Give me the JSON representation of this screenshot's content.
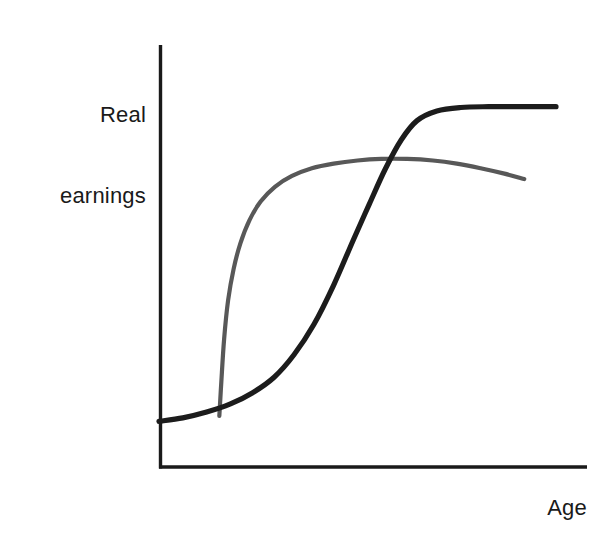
{
  "chart_data": {
    "type": "line",
    "title": "",
    "subtitle": "",
    "xlabel": "Age",
    "ylabel": "Real earnings",
    "ylabel_lines": [
      "Real",
      "earnings"
    ],
    "grid": false,
    "legend": "none",
    "axes": {
      "x_axis_visible": true,
      "y_axis_visible": true,
      "x_ticks": [],
      "y_ticks": [],
      "xlim": [
        0,
        1
      ],
      "ylim": [
        0,
        1
      ],
      "axis_color": "#1a1a1a"
    },
    "annotations": [],
    "series": [
      {
        "name": "high-skill-profile",
        "color": "#1c1c1c",
        "width": 5.2,
        "description": "S-shaped real earnings profile rising late and plateauing at a high level",
        "x": [
          0.0,
          0.06,
          0.12,
          0.18,
          0.236,
          0.29,
          0.34,
          0.39,
          0.44,
          0.49,
          0.53,
          0.57,
          0.61,
          0.65,
          0.7,
          0.76,
          0.83,
          0.9,
          0.96,
          1.0
        ],
        "y": [
          0.118,
          0.127,
          0.142,
          0.163,
          0.192,
          0.232,
          0.29,
          0.368,
          0.47,
          0.588,
          0.68,
          0.77,
          0.845,
          0.895,
          0.92,
          0.929,
          0.931,
          0.931,
          0.931,
          0.931
        ]
      },
      {
        "name": "low-skill-profile",
        "color": "#585858",
        "width": 4.2,
        "description": "Concave real earnings profile rising sharply early, peaking and declining slightly",
        "x": [
          0.152,
          0.157,
          0.164,
          0.174,
          0.188,
          0.205,
          0.228,
          0.256,
          0.292,
          0.335,
          0.385,
          0.44,
          0.5,
          0.56,
          0.625,
          0.69,
          0.75,
          0.81,
          0.87,
          0.92
        ],
        "y": [
          0.132,
          0.22,
          0.33,
          0.43,
          0.512,
          0.578,
          0.638,
          0.686,
          0.724,
          0.752,
          0.772,
          0.784,
          0.792,
          0.796,
          0.796,
          0.792,
          0.784,
          0.772,
          0.758,
          0.744
        ]
      }
    ]
  },
  "figure": {
    "background": "#ffffff",
    "y_axis_label": "Real earnings",
    "y_axis_label_line1": "Real",
    "y_axis_label_line2": "earnings",
    "x_axis_label": "Age"
  }
}
